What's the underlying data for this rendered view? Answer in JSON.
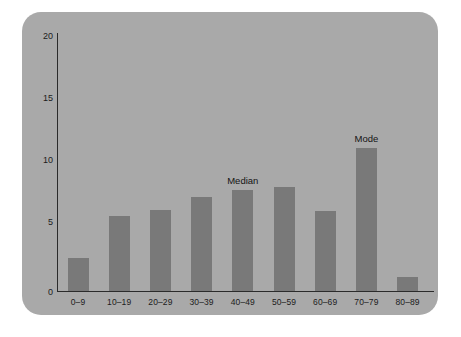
{
  "chart_data": {
    "type": "bar",
    "title": "",
    "subtitle": "",
    "xlabel": "",
    "ylabel": "",
    "categories": [
      "0–9",
      "10–19",
      "20–29",
      "30–39",
      "40–49",
      "50–59",
      "60–69",
      "70–79",
      "80–89"
    ],
    "values": [
      2.6,
      5.9,
      6.4,
      7.4,
      7.9,
      8.2,
      6.3,
      11.2,
      1.1
    ],
    "ylim": [
      0,
      21
    ],
    "yticks": [
      0,
      5,
      10,
      15,
      20
    ],
    "ytick_labels": [
      "0",
      "5",
      "10",
      "15",
      "20"
    ],
    "grid": false,
    "legend": null,
    "annotations": [
      {
        "text": "Median",
        "category": "40–49",
        "value": 7.9
      },
      {
        "text": "Mode",
        "category": "70–79",
        "value": 11.2
      }
    ],
    "colors": {
      "bar": "#797979",
      "panel_background": "#a9a9a9",
      "page_background": "#ffffff",
      "axis": "#2b2b2b",
      "text": "#1c1c1c"
    }
  }
}
